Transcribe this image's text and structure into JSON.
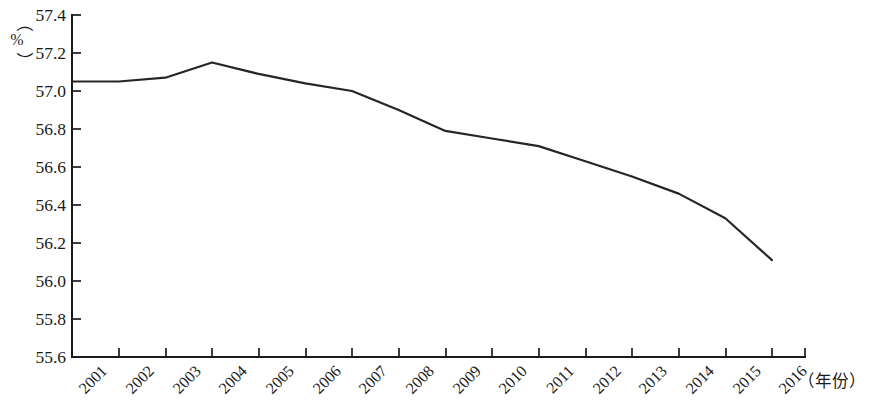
{
  "chart_data": {
    "type": "line",
    "title": "",
    "subtitle": "",
    "xlabel": "（年份）",
    "ylabel": "（%）",
    "unit_symbol": "%",
    "categories": [
      "2001",
      "2002",
      "2003",
      "2004",
      "2005",
      "2006",
      "2007",
      "2008",
      "2009",
      "2010",
      "2011",
      "2012",
      "2013",
      "2014",
      "2015",
      "2016"
    ],
    "x": [
      2001,
      2002,
      2003,
      2004,
      2005,
      2006,
      2007,
      2008,
      2009,
      2010,
      2011,
      2012,
      2013,
      2014,
      2015,
      2016
    ],
    "values": [
      57.05,
      57.05,
      57.07,
      57.15,
      57.09,
      57.04,
      57.0,
      56.9,
      56.79,
      56.75,
      56.71,
      56.63,
      56.55,
      56.46,
      56.33,
      56.11
    ],
    "series": [
      {
        "name": "",
        "values": [
          57.05,
          57.05,
          57.07,
          57.15,
          57.09,
          57.04,
          57.0,
          56.9,
          56.79,
          56.75,
          56.71,
          56.63,
          56.55,
          56.46,
          56.33,
          56.11
        ],
        "color": "#262626"
      }
    ],
    "ylim": [
      55.6,
      57.4
    ],
    "yticks": [
      55.6,
      55.8,
      56.0,
      56.2,
      56.4,
      56.6,
      56.8,
      57.0,
      57.2,
      57.4
    ],
    "ytick_labels": [
      "55.6",
      "55.8",
      "56.0",
      "56.2",
      "56.4",
      "56.6",
      "56.8",
      "57.0",
      "57.2",
      "57.4"
    ],
    "xtick_labels": [
      "2001",
      "2002",
      "2003",
      "2004",
      "2005",
      "2006",
      "2007",
      "2008",
      "2009",
      "2010",
      "2011",
      "2012",
      "2013",
      "2014",
      "2015",
      "2016"
    ],
    "xtick_rotation_deg": 45,
    "grid": false,
    "legend": false,
    "legend_position": "none",
    "markers": false,
    "line_color": "#262626",
    "axis_color": "#1a1a1a",
    "background": "#ffffff"
  },
  "axes": {
    "y_unit_text": "%",
    "y_unit_open_paren": "（",
    "y_unit_close_paren": "）",
    "x_axis_caption": "（年份）"
  }
}
